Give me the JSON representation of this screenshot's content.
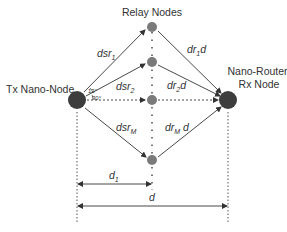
{
  "diagram": {
    "title": "Relay Nodes",
    "tx_node": {
      "label": "Tx Nano-Node"
    },
    "rx_node": {
      "label_line1": "Nano-Router/",
      "label_line2": "Rx Node"
    },
    "angles": {
      "upper": "13°",
      "lower": "30°"
    },
    "links_tx_to_relay": [
      {
        "base": "dsr",
        "sub": "1"
      },
      {
        "base": "dsr",
        "sub": "2"
      },
      {
        "base": "dsr",
        "sub": "M"
      }
    ],
    "links_relay_to_rx": [
      {
        "base": "dr",
        "sub": "1",
        "suffix": "d"
      },
      {
        "base": "dr",
        "sub": "2",
        "suffix": "d"
      },
      {
        "base": "dr",
        "sub": "M",
        "suffix": " d"
      }
    ],
    "dimensions": {
      "d1": {
        "base": "d",
        "sub": "1"
      },
      "d": {
        "base": "d"
      }
    },
    "colors": {
      "node": "#3d3d3d",
      "relay": "#7a7a7a",
      "line": "#333333"
    }
  }
}
